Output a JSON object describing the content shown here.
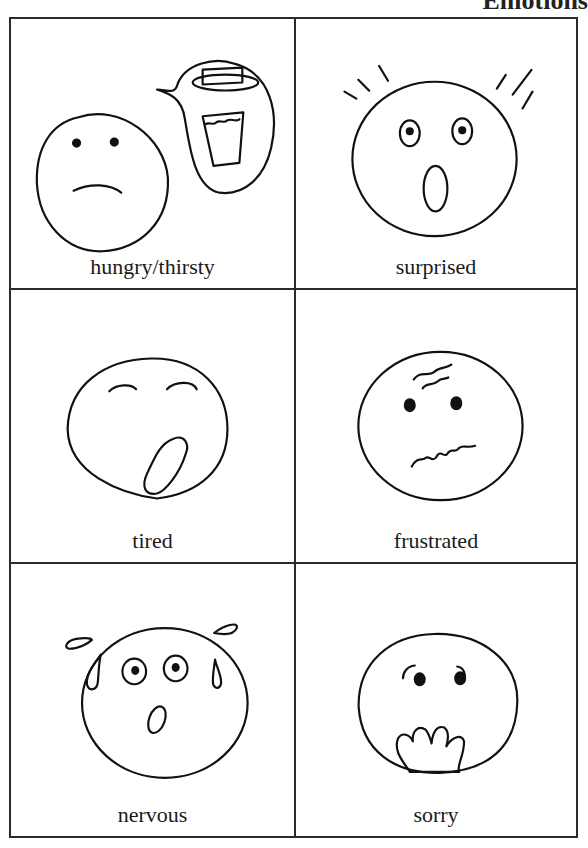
{
  "heading": "Emotions",
  "cards": [
    {
      "label": "hungry/thirsty",
      "icon": "hungry-thirsty-face-icon"
    },
    {
      "label": "surprised",
      "icon": "surprised-face-icon"
    },
    {
      "label": "tired",
      "icon": "tired-face-icon"
    },
    {
      "label": "frustrated",
      "icon": "frustrated-face-icon"
    },
    {
      "label": "nervous",
      "icon": "nervous-face-icon"
    },
    {
      "label": "sorry",
      "icon": "sorry-face-icon"
    }
  ],
  "colors": {
    "ink": "#111111",
    "paper": "#ffffff",
    "border": "#2a2a2a"
  }
}
